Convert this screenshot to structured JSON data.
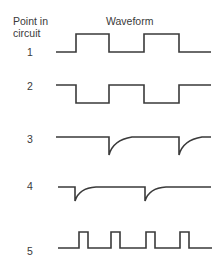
{
  "header": {
    "column_left_line1": "Point in",
    "column_left_line2": "circuit",
    "column_right": "Waveform"
  },
  "rows": [
    {
      "point": "1",
      "waveform": "square-wave"
    },
    {
      "point": "2",
      "waveform": "inverted-square-wave"
    },
    {
      "point": "3",
      "waveform": "negative-spikes-differentiated"
    },
    {
      "point": "4",
      "waveform": "negative-spikes-differentiated-shifted"
    },
    {
      "point": "5",
      "waveform": "narrow-pulse-train"
    }
  ],
  "colors": {
    "ink": "#3a3a3a",
    "background": "#ffffff"
  }
}
